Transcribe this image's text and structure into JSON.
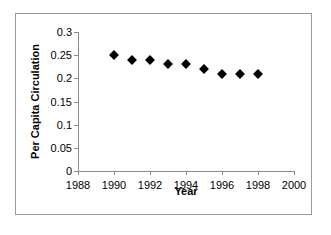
{
  "chart_data": {
    "type": "scatter",
    "title": "",
    "xlabel": "Year",
    "ylabel": "Per Capita Circulation",
    "x": [
      1990,
      1991,
      1992,
      1993,
      1994,
      1995,
      1996,
      1997,
      1998
    ],
    "values": [
      0.25,
      0.24,
      0.24,
      0.23,
      0.23,
      0.22,
      0.21,
      0.21,
      0.21
    ],
    "series": [
      {
        "name": "Per Capita Circulation",
        "values": [
          0.25,
          0.24,
          0.24,
          0.23,
          0.23,
          0.22,
          0.21,
          0.21,
          0.21
        ]
      }
    ],
    "xlim": [
      1988,
      2000
    ],
    "ylim": [
      0,
      0.3
    ],
    "xticks": [
      1988,
      1990,
      1992,
      1994,
      1996,
      1998,
      2000
    ],
    "xtick_labels": [
      "1988",
      "1990",
      "1992",
      "1994",
      "1996",
      "1998",
      "2000"
    ],
    "yticks": [
      0,
      0.05,
      0.1,
      0.15,
      0.2,
      0.25,
      0.3
    ],
    "ytick_labels": [
      "0",
      "0.05",
      "0.1",
      "0.15",
      "0.2",
      "0.25",
      "0.3"
    ],
    "grid": false,
    "legend": false,
    "marker": "diamond",
    "marker_color": "#000000",
    "axis_color": "#8c8c8c",
    "frame_color": "#9a9a9a",
    "background": "#ffffff"
  }
}
